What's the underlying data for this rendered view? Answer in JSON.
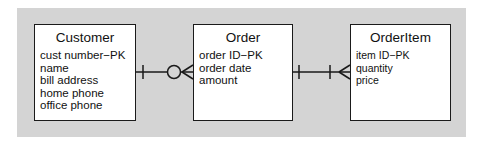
{
  "diagram": {
    "type": "entity-relationship",
    "background_color": "#d4d4d4",
    "entities": [
      {
        "name": "Customer",
        "attributes": [
          "cust number−PK",
          "name",
          "bill address",
          "home phone",
          "office phone"
        ]
      },
      {
        "name": "Order",
        "attributes": [
          "order ID−PK",
          "order date",
          "amount"
        ]
      },
      {
        "name": "OrderItem",
        "attributes": [
          "item ID−PK",
          "quantity",
          "price"
        ]
      }
    ],
    "relationships": [
      {
        "from": "Customer",
        "to": "Order",
        "from_cardinality": "one",
        "to_cardinality": "zero-or-many"
      },
      {
        "from": "Order",
        "to": "OrderItem",
        "from_cardinality": "one",
        "to_cardinality": "one-or-many"
      }
    ]
  }
}
